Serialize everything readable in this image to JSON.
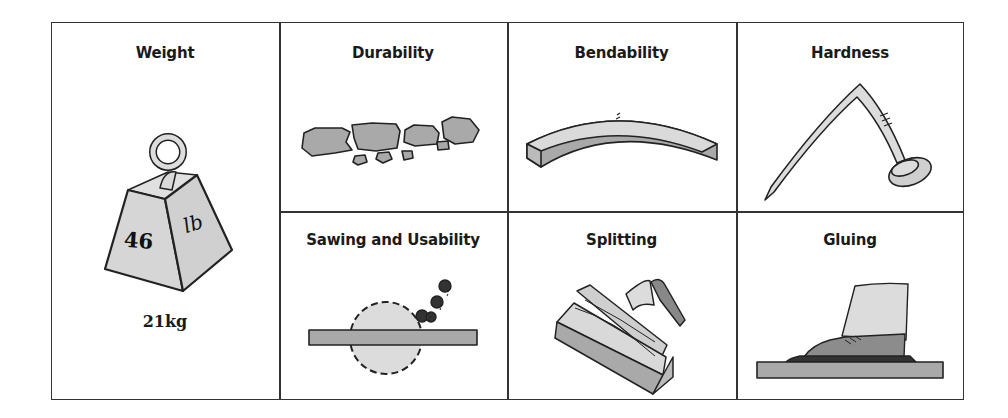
{
  "properties": [
    {
      "id": "weight",
      "title": "Weight",
      "illustration": "weight-icon",
      "weight_label": "46",
      "unit_label": "lb",
      "caption": "21kg"
    },
    {
      "id": "durability",
      "title": "Durability",
      "illustration": "broken-pieces-icon"
    },
    {
      "id": "bendability",
      "title": "Bendability",
      "illustration": "bent-beam-icon"
    },
    {
      "id": "hardness",
      "title": "Hardness",
      "illustration": "bent-nail-icon"
    },
    {
      "id": "sawing",
      "title": "Sawing and Usability",
      "illustration": "circular-saw-icon"
    },
    {
      "id": "splitting",
      "title": "Splitting",
      "illustration": "split-log-axe-icon"
    },
    {
      "id": "gluing",
      "title": "Gluing",
      "illustration": "shoe-on-glued-board-icon"
    }
  ],
  "colors": {
    "line": "#333333",
    "fill_light": "#d6d6d6",
    "fill_mid": "#a9a9a9",
    "fill_dark": "#555555",
    "text": "#1a1a1a"
  }
}
